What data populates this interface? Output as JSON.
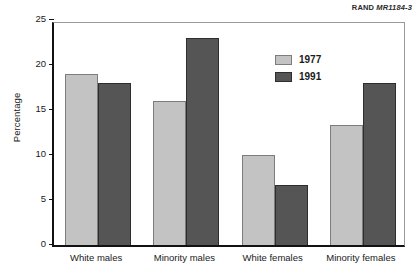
{
  "source_tag": {
    "org": "RAND",
    "id": "MR1184-3"
  },
  "legend": {
    "position": "inside-top-center",
    "entries": [
      {
        "label": "1977",
        "color": "#c3c3c3"
      },
      {
        "label": "1991",
        "color": "#555555"
      }
    ]
  },
  "chart_data": {
    "type": "bar",
    "title": "",
    "xlabel": "",
    "ylabel": "Percentage",
    "ylim": [
      0,
      25
    ],
    "yticks": [
      0,
      5,
      10,
      15,
      20,
      25
    ],
    "ytick_labels": [
      "0",
      "5",
      "10",
      "15",
      "20",
      "25"
    ],
    "grid": false,
    "categories": [
      "White males",
      "Minority males",
      "White females",
      "Minority females"
    ],
    "series": [
      {
        "name": "1977",
        "color": "#c3c3c3",
        "values": [
          19,
          16,
          10,
          13.3
        ]
      },
      {
        "name": "1991",
        "color": "#555555",
        "values": [
          18,
          23,
          6.7,
          18
        ]
      }
    ]
  }
}
